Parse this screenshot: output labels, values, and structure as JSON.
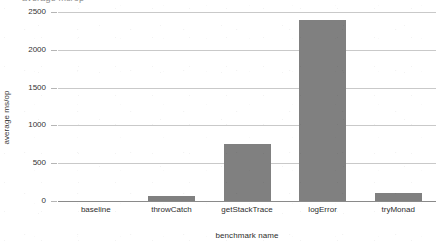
{
  "figure": {
    "clipped_top_title": "average ms/op",
    "background_color": "#ffffff",
    "bar_color": "#808080",
    "gridline_color": "#c9c9c9",
    "axis_color": "#8a8a8a"
  },
  "chart_data": {
    "type": "bar",
    "title": "",
    "categories": [
      "baseline",
      "throwCatch",
      "getStackTrace",
      "logError",
      "tryMonad"
    ],
    "values": [
      0,
      70,
      760,
      2400,
      105
    ],
    "xlabel": "benchmark name",
    "ylabel": "average ms/op",
    "ylim": [
      0,
      2500
    ],
    "ytick_labels": [
      "0",
      "500",
      "1000",
      "1500",
      "2000",
      "2500"
    ],
    "ytick_values": [
      0,
      500,
      1000,
      1500,
      2000,
      2500
    ],
    "grid": true,
    "legend": false,
    "orientation": "vertical",
    "series": [
      {
        "name": "average ms/op",
        "values": [
          0,
          70,
          760,
          2400,
          105
        ],
        "color": "#808080"
      }
    ]
  },
  "axes": {
    "y_title": "average ms/op",
    "x_title": "benchmark name"
  }
}
